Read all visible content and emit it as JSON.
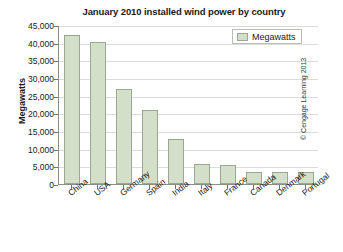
{
  "chart_data": {
    "type": "bar",
    "title": "January 2010 installed wind power by country",
    "xlabel": "",
    "ylabel": "Megawatts",
    "categories": [
      "China",
      "USA",
      "Germany",
      "Spain",
      "India",
      "Italy",
      "France",
      "Canada",
      "Denmark",
      "Portugal"
    ],
    "values": [
      42300,
      40200,
      27000,
      21000,
      12800,
      5800,
      5500,
      3500,
      3400,
      3400
    ],
    "series": [
      {
        "name": "Megawatts",
        "values": [
          42300,
          40200,
          27000,
          21000,
          12800,
          5800,
          5500,
          3500,
          3400,
          3400
        ]
      }
    ],
    "ylim": [
      0,
      45000
    ],
    "ytick_values": [
      0,
      5000,
      10000,
      15000,
      20000,
      25000,
      30000,
      35000,
      40000,
      45000
    ],
    "ytick_labels": [
      "0",
      "5,000",
      "10,000",
      "15,000",
      "20,000",
      "25,000",
      "30,000",
      "35,000",
      "40,000",
      "45,000"
    ],
    "grid": true,
    "grid_axis": "y",
    "legend": {
      "position": "top-right",
      "entries": [
        "Megawatts"
      ]
    },
    "colors": {
      "bar_fill": "#d3dfc8",
      "bar_border": "#9aa795",
      "gridline": "#d9dcd8",
      "axis": "#8a8f86",
      "text": "#1a1a1a",
      "background": "#ffffff"
    }
  },
  "credit": {
    "text": "© Cengage Learning 2013"
  }
}
